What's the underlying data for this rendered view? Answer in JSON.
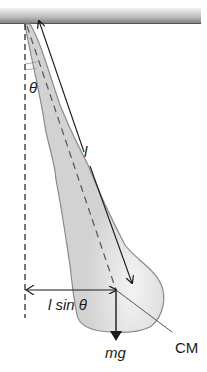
{
  "diagram": {
    "type": "physical pendulum (hanging leg)",
    "labels": {
      "theta": "θ",
      "length": "l",
      "lever_arm": "l sin θ",
      "center_of_mass": "CM",
      "weight": "mg"
    },
    "colors": {
      "body_fill": "#d4d4d4",
      "body_stroke": "#8a8a8a",
      "line": "#1a1a1a",
      "bar_light": "#e6e6e6",
      "bar_dark": "#8c8c8c"
    }
  }
}
